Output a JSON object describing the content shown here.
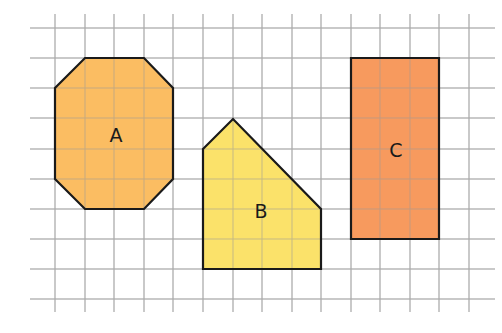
{
  "grid": {
    "x_lines": [
      55,
      85,
      114,
      144,
      173,
      203,
      233,
      262,
      292,
      321,
      351,
      380,
      410,
      439,
      469
    ],
    "y_lines": [
      28,
      58,
      88,
      118,
      149,
      179,
      209,
      239,
      269,
      299
    ],
    "h_extent": [
      30,
      495
    ],
    "v_extent": [
      14,
      312
    ],
    "line_color": "#b9b9b9"
  },
  "shapes": [
    {
      "id": "A",
      "label": "A",
      "kind": "octagon",
      "fill": "#fbbd62",
      "points": [
        [
          85,
          58
        ],
        [
          144,
          58
        ],
        [
          173,
          88
        ],
        [
          173,
          179
        ],
        [
          144,
          209
        ],
        [
          85,
          209
        ],
        [
          55,
          179
        ],
        [
          55,
          88
        ]
      ],
      "label_pos": [
        116,
        135
      ]
    },
    {
      "id": "B",
      "label": "B",
      "kind": "pentagon",
      "fill": "#fbe26a",
      "points": [
        [
          203,
          149
        ],
        [
          233,
          119
        ],
        [
          321,
          209
        ],
        [
          321,
          269
        ],
        [
          203,
          269
        ]
      ],
      "label_pos": [
        261,
        211
      ]
    },
    {
      "id": "C",
      "label": "C",
      "kind": "rectangle",
      "fill": "#f79a5e",
      "points": [
        [
          351,
          58
        ],
        [
          439,
          58
        ],
        [
          439,
          239
        ],
        [
          351,
          239
        ]
      ],
      "label_pos": [
        396,
        150
      ]
    }
  ],
  "stroke_color": "#1a1a1a"
}
